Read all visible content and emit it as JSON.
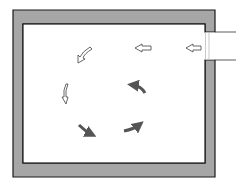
{
  "diagram": {
    "type": "room-airflow",
    "colors": {
      "wall_fill": "#a6a6a6",
      "wall_stroke": "#1a1a1a",
      "room_fill": "#ffffff",
      "outline_arrow_fill": "#ffffff",
      "outline_arrow_stroke": "#555555",
      "solid_arrow_fill": "#555555"
    },
    "room": {
      "outer": {
        "x": 13,
        "y": 10,
        "w": 202,
        "h": 167
      },
      "inner": {
        "x": 23,
        "y": 24,
        "w": 182,
        "h": 139
      }
    },
    "inlet": {
      "side": "right",
      "y_top": 32,
      "y_bottom": 60,
      "duct_length": 28
    },
    "arrows": [
      {
        "id": "inlet-arrow-1",
        "style": "outline",
        "direction": "left"
      },
      {
        "id": "inlet-arrow-2",
        "style": "outline",
        "direction": "left"
      },
      {
        "id": "flow-arrow-down-left",
        "style": "outline",
        "direction": "down-left"
      },
      {
        "id": "flow-arrow-down",
        "style": "outline",
        "direction": "down"
      },
      {
        "id": "flow-arrow-down-right",
        "style": "solid",
        "direction": "down-right"
      },
      {
        "id": "flow-arrow-up-right",
        "style": "solid",
        "direction": "up-right"
      },
      {
        "id": "flow-arrow-up-left",
        "style": "solid",
        "direction": "up-left"
      }
    ]
  }
}
